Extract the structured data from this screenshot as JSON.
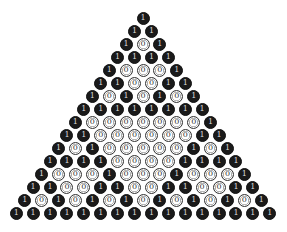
{
  "diagram": {
    "title": "",
    "rows": 16,
    "one_label": "1",
    "zero_label": "0",
    "colors": {
      "one_fill": "#1a1a1a",
      "one_text": "#d8d8d8",
      "zero_fill": "#ffffff",
      "zero_stroke": "#333333"
    },
    "layout": {
      "top_x": 143,
      "top_y": 18,
      "dx": 16.9,
      "dy": 13,
      "diameter": 13
    },
    "values": [
      [
        1
      ],
      [
        1,
        1
      ],
      [
        1,
        0,
        1
      ],
      [
        1,
        1,
        1,
        1
      ],
      [
        1,
        0,
        0,
        0,
        1
      ],
      [
        1,
        1,
        0,
        0,
        1,
        1
      ],
      [
        1,
        0,
        1,
        0,
        1,
        0,
        1
      ],
      [
        1,
        1,
        1,
        1,
        1,
        1,
        1,
        1
      ],
      [
        1,
        0,
        0,
        0,
        0,
        0,
        0,
        0,
        1
      ],
      [
        1,
        1,
        0,
        0,
        0,
        0,
        0,
        0,
        1,
        1
      ],
      [
        1,
        0,
        1,
        0,
        0,
        0,
        0,
        0,
        1,
        0,
        1
      ],
      [
        1,
        1,
        1,
        1,
        0,
        0,
        0,
        0,
        1,
        1,
        1,
        1
      ],
      [
        1,
        0,
        0,
        0,
        1,
        0,
        0,
        0,
        1,
        0,
        0,
        0,
        1
      ],
      [
        1,
        1,
        0,
        0,
        1,
        1,
        0,
        0,
        1,
        1,
        0,
        0,
        1,
        1
      ],
      [
        1,
        0,
        1,
        0,
        1,
        0,
        1,
        0,
        1,
        0,
        1,
        0,
        1,
        0,
        1
      ],
      [
        1,
        1,
        1,
        1,
        1,
        1,
        1,
        1,
        1,
        1,
        1,
        1,
        1,
        1,
        1,
        1
      ]
    ]
  }
}
